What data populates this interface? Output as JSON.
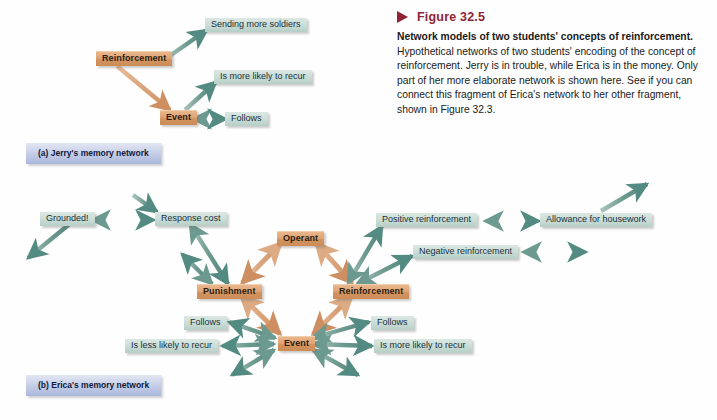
{
  "figure": {
    "marker_icon": "triangle-right-icon",
    "number": "Figure 32.5",
    "title": "Network models of two students' concepts of reinforcement.",
    "body": " Hypothetical networks of two students' encoding of the concept of reinforcement. Jerry is in trouble, while Erica is in the money. Only part of her more elaborate network is shown here. See if you can connect this fragment of Erica's network to her other fragment, shown in Figure 32.3.",
    "accent_color": "#8e2436"
  },
  "colors": {
    "concept_node": "#dfa475",
    "proposition_node": "#c7dad3",
    "plate": "#bcc7e3",
    "teal_link": "#5f8e84",
    "orange_link": "#d4a07a",
    "background": "#fefefe"
  },
  "networks": [
    {
      "id": "jerry",
      "caption": "(a) Jerry's memory network",
      "nodes": [
        {
          "id": "j-sending",
          "label": "Sending more soldiers",
          "kind": "prop",
          "x": 205,
          "y": 18
        },
        {
          "id": "j-reinforcement",
          "label": "Reinforcement",
          "kind": "concept",
          "x": 96,
          "y": 51
        },
        {
          "id": "j-recur",
          "label": "Is more likely to recur",
          "kind": "prop",
          "x": 214,
          "y": 70
        },
        {
          "id": "j-event",
          "label": "Event",
          "kind": "concept",
          "x": 160,
          "y": 110
        },
        {
          "id": "j-follows",
          "label": "Follows",
          "kind": "prop",
          "x": 225,
          "y": 112
        }
      ]
    },
    {
      "id": "erica",
      "caption": "(b) Erica's memory network",
      "nodes": [
        {
          "id": "e-grounded",
          "label": "Grounded!",
          "kind": "prop",
          "x": 40,
          "y": 212
        },
        {
          "id": "e-respcost",
          "label": "Response cost",
          "kind": "prop",
          "x": 155,
          "y": 212
        },
        {
          "id": "e-operant",
          "label": "Operant",
          "kind": "concept",
          "x": 277,
          "y": 231
        },
        {
          "id": "e-posreinf",
          "label": "Positive reinforcement",
          "kind": "prop",
          "x": 376,
          "y": 213
        },
        {
          "id": "e-allowance",
          "label": "Allowance for housework",
          "kind": "prop",
          "x": 540,
          "y": 213
        },
        {
          "id": "e-negreinf",
          "label": "Negative reinforcement",
          "kind": "prop",
          "x": 413,
          "y": 245
        },
        {
          "id": "e-punishment",
          "label": "Punishment",
          "kind": "concept",
          "x": 197,
          "y": 284
        },
        {
          "id": "e-reinf",
          "label": "Reinforcement",
          "kind": "concept",
          "x": 333,
          "y": 284
        },
        {
          "id": "e-follows-l",
          "label": "Follows",
          "kind": "prop",
          "x": 184,
          "y": 316
        },
        {
          "id": "e-follows-r",
          "label": "Follows",
          "kind": "prop",
          "x": 371,
          "y": 316
        },
        {
          "id": "e-less",
          "label": "Is less likely to recur",
          "kind": "prop",
          "x": 125,
          "y": 339
        },
        {
          "id": "e-event",
          "label": "Event",
          "kind": "concept",
          "x": 278,
          "y": 336
        },
        {
          "id": "e-more",
          "label": "Is more likely to recur",
          "kind": "prop",
          "x": 374,
          "y": 339
        }
      ],
      "links": [
        {
          "from": "e-grounded",
          "to": "e-respcost",
          "style": "teal",
          "heads": "both"
        },
        {
          "from": "e-punishment",
          "to": "e-respcost",
          "style": "teal",
          "heads": "both"
        },
        {
          "from": "e-operant",
          "to": "e-punishment",
          "style": "orange",
          "heads": "both"
        },
        {
          "from": "e-operant",
          "to": "e-reinf",
          "style": "orange",
          "heads": "both"
        },
        {
          "from": "e-reinf",
          "to": "e-posreinf",
          "style": "teal",
          "heads": "both"
        },
        {
          "from": "e-reinf",
          "to": "e-negreinf",
          "style": "teal",
          "heads": "both"
        },
        {
          "from": "e-posreinf",
          "to": "e-allowance",
          "style": "teal",
          "heads": "both"
        },
        {
          "from": "e-punishment",
          "to": "e-event",
          "style": "orange",
          "heads": "both"
        },
        {
          "from": "e-reinf",
          "to": "e-event",
          "style": "orange",
          "heads": "both"
        },
        {
          "from": "e-event",
          "to": "e-follows-l",
          "style": "teal",
          "heads": "both"
        },
        {
          "from": "e-event",
          "to": "e-less",
          "style": "teal",
          "heads": "both"
        },
        {
          "from": "e-event",
          "to": "e-follows-r",
          "style": "teal",
          "heads": "both"
        },
        {
          "from": "e-event",
          "to": "e-more",
          "style": "teal",
          "heads": "both"
        }
      ]
    }
  ]
}
